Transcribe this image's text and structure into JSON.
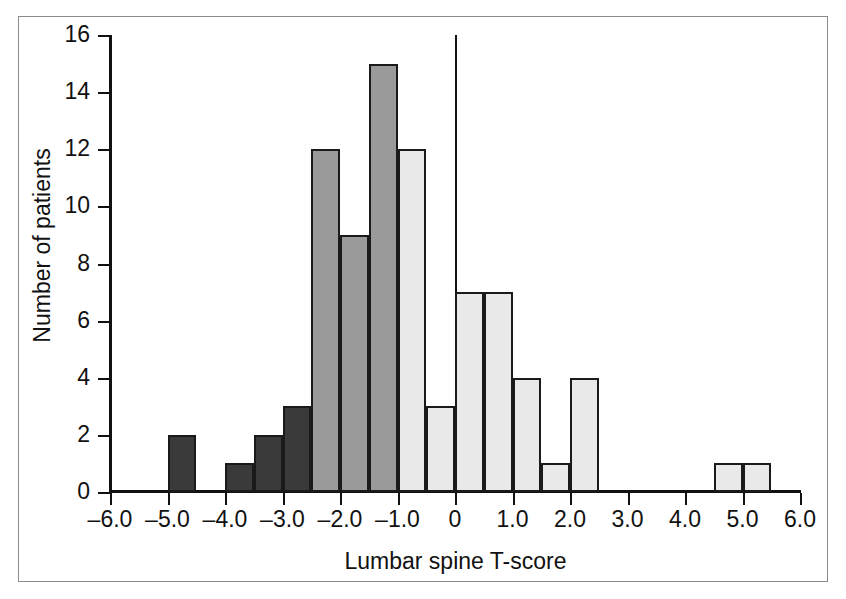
{
  "chart_data": {
    "type": "bar",
    "title": "",
    "subtitle": "",
    "xlabel": "Lumbar spine T-score",
    "ylabel": "Number of patients",
    "xlim": [
      -6.0,
      6.0
    ],
    "ylim": [
      0,
      16
    ],
    "bin_width": 0.5,
    "grid": false,
    "legend": null,
    "xticks": [
      "–6.0",
      "–5.0",
      "–4.0",
      "–3.0",
      "–2.0",
      "–1.0",
      "0",
      "1.0",
      "2.0",
      "3.0",
      "4.0",
      "5.0",
      "6.0"
    ],
    "xtick_values": [
      -6.0,
      -5.0,
      -4.0,
      -3.0,
      -2.0,
      -1.0,
      0,
      1.0,
      2.0,
      3.0,
      4.0,
      5.0,
      6.0
    ],
    "yticks": [
      "0",
      "2",
      "4",
      "6",
      "8",
      "10",
      "12",
      "14",
      "16"
    ],
    "ytick_values": [
      0,
      2,
      4,
      6,
      8,
      10,
      12,
      14,
      16
    ],
    "annotations": [
      "vertical reference line at T-score = 0"
    ],
    "colors": {
      "dark": "#3a3a3a",
      "medium": "#9a9a9a",
      "light": "#e9e9e9",
      "outline": "#1a1a1a",
      "axis": "#111111",
      "frame": "#8b8b8b"
    },
    "bins": [
      {
        "start": -5.0,
        "end": -4.5,
        "value": 2,
        "group": "dark"
      },
      {
        "start": -4.0,
        "end": -3.5,
        "value": 1,
        "group": "dark"
      },
      {
        "start": -3.5,
        "end": -3.0,
        "value": 2,
        "group": "dark"
      },
      {
        "start": -3.0,
        "end": -2.5,
        "value": 3,
        "group": "dark"
      },
      {
        "start": -2.5,
        "end": -2.0,
        "value": 12,
        "group": "medium"
      },
      {
        "start": -2.0,
        "end": -1.5,
        "value": 9,
        "group": "medium"
      },
      {
        "start": -1.5,
        "end": -1.0,
        "value": 15,
        "group": "medium"
      },
      {
        "start": -1.0,
        "end": -0.5,
        "value": 12,
        "group": "light"
      },
      {
        "start": -0.5,
        "end": 0.0,
        "value": 3,
        "group": "light"
      },
      {
        "start": 0.0,
        "end": 0.5,
        "value": 7,
        "group": "light"
      },
      {
        "start": 0.5,
        "end": 1.0,
        "value": 7,
        "group": "light"
      },
      {
        "start": 1.0,
        "end": 1.5,
        "value": 4,
        "group": "light"
      },
      {
        "start": 1.5,
        "end": 2.0,
        "value": 1,
        "group": "light"
      },
      {
        "start": 2.0,
        "end": 2.5,
        "value": 4,
        "group": "light"
      },
      {
        "start": 4.5,
        "end": 5.0,
        "value": 1,
        "group": "light"
      },
      {
        "start": 5.0,
        "end": 5.5,
        "value": 1,
        "group": "light"
      }
    ]
  }
}
